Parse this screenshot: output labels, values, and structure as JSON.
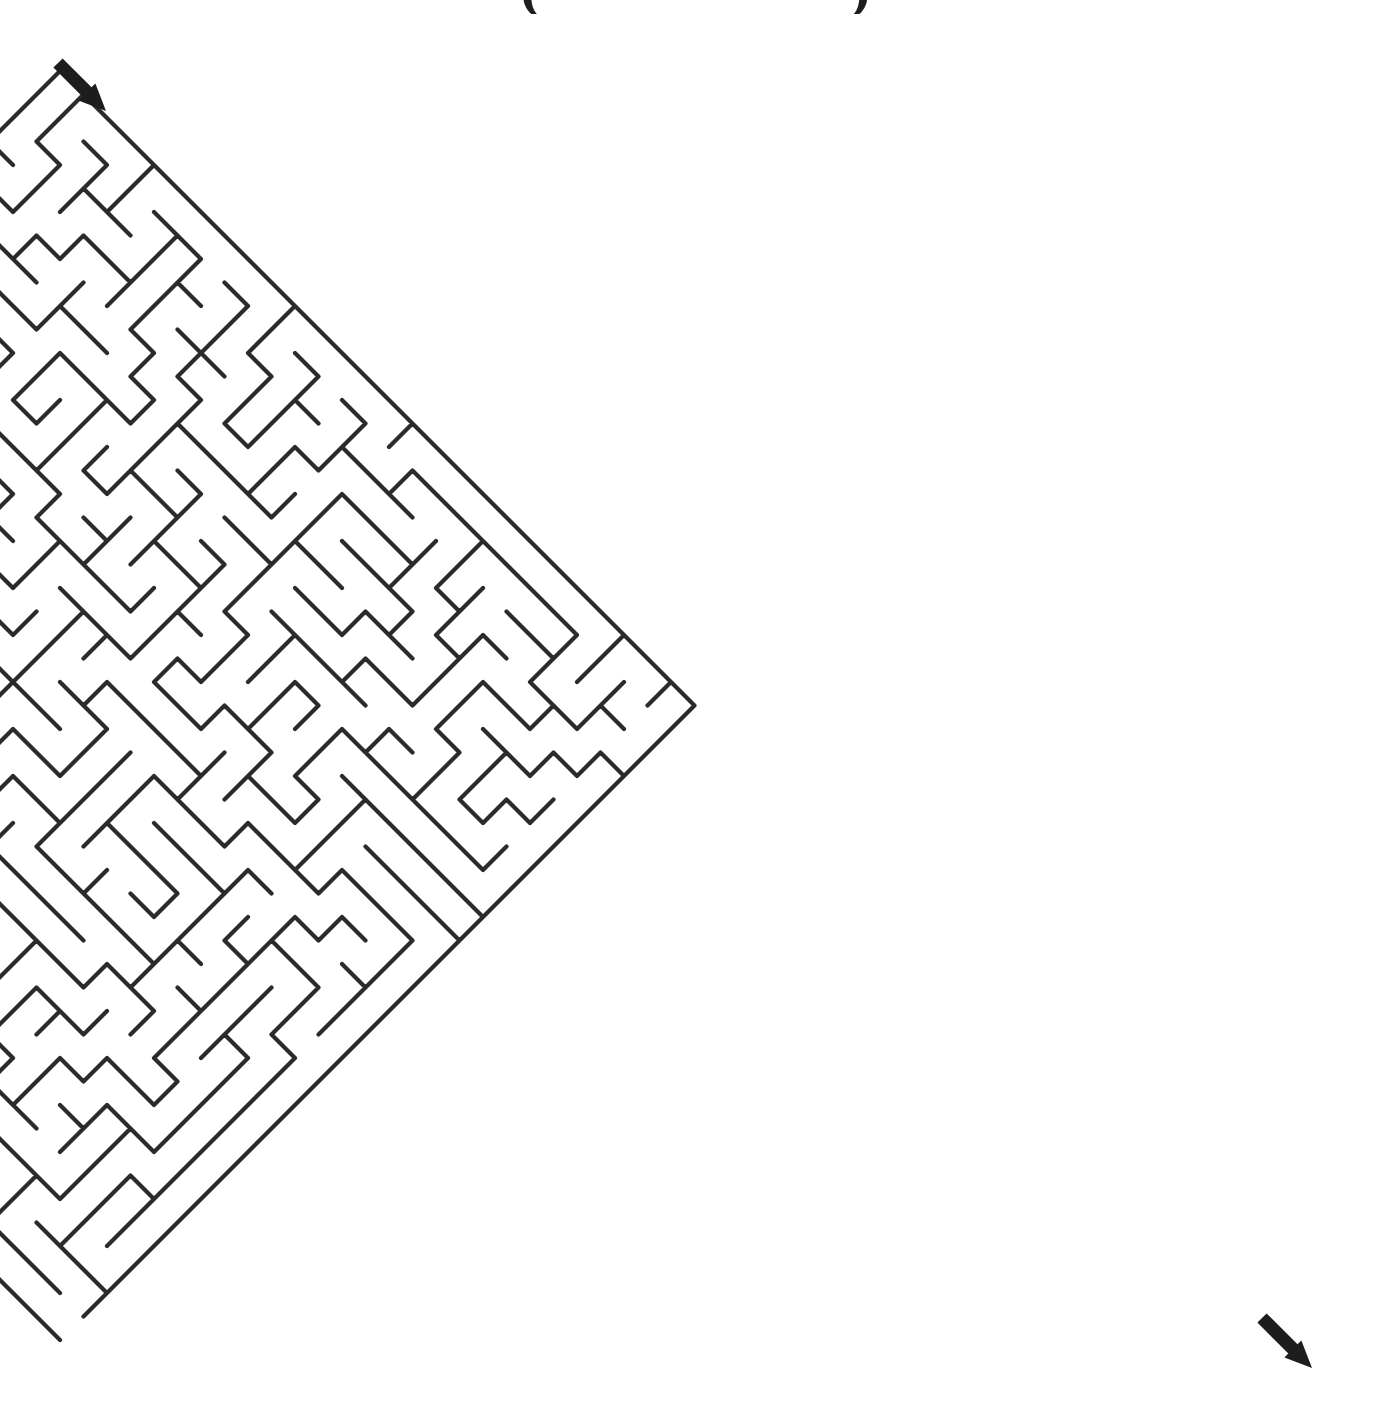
{
  "page": {
    "width": 1385,
    "height": 1426,
    "background": "#ffffff",
    "kind": "maze-puzzle"
  },
  "title_fragment": {
    "note": "Title is cropped off the top edge; only the lower tips of two parenthesis glyphs remain visible.",
    "left_glyph": "(",
    "right_glyph": ")",
    "left_x": 520,
    "right_x": 850,
    "color": "#1d1d1d"
  },
  "maze": {
    "style": "diagonal",
    "wall_color": "#2b2b2b",
    "background_color": "#ffffff",
    "stroke_width": 4.2,
    "cols": 27,
    "rows": 27,
    "half_pitch": 23.5,
    "origin_x": 60,
    "origin_y": 71,
    "seed": 20240517,
    "bounds": {
      "left": 60,
      "top": 71,
      "right": 1325,
      "bottom": 1368
    }
  },
  "entry": {
    "label": "entry-arrow",
    "direction": "southeast",
    "tail_x": 58,
    "tail_y": 63,
    "tip_x": 106,
    "tip_y": 111,
    "color": "#1d1d1d"
  },
  "exit": {
    "label": "exit-arrow",
    "direction": "southeast",
    "tail_x": 1262,
    "tail_y": 1318,
    "tip_x": 1312,
    "tip_y": 1368,
    "color": "#1d1d1d"
  }
}
